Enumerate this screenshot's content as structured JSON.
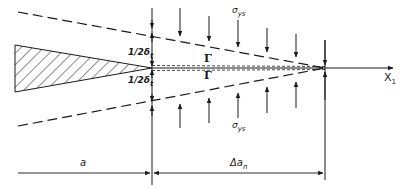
{
  "figure": {
    "type": "strip-yield crack tip diagram",
    "labels": {
      "sigma_top": {
        "main": "σ",
        "sub": "ys"
      },
      "sigma_bottom": {
        "main": "σ",
        "sub": "ys"
      },
      "half_delta_top": {
        "main": "1/2δ",
        "sub": "t"
      },
      "half_delta_bottom": {
        "main": "1/2δ",
        "sub": "t"
      },
      "gamma_top": "Γ",
      "gamma_bottom": "Γ",
      "axis": {
        "main": "X",
        "sub": "1"
      },
      "crack_length": "a",
      "increment": {
        "main": "Δa",
        "sub": "n"
      }
    },
    "colors": {
      "line": "#1a1a1a",
      "background": "#ffffff"
    },
    "arrow_positions_x": [
      180,
      209,
      238,
      267,
      296,
      325
    ]
  }
}
